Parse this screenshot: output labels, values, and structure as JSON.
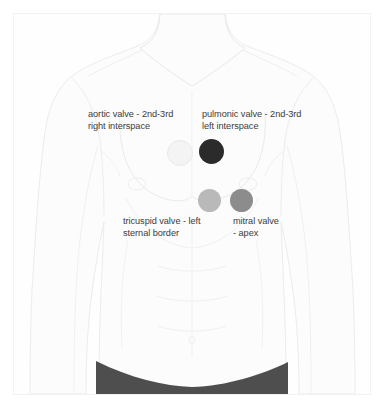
{
  "diagram": {
    "background_color": "#ffffff",
    "frame_color": "#f2f2f2",
    "body_outline_color": "#ebebeb",
    "body_fill_color": "#fdfdfd",
    "waistband_color": "#4e4e4e",
    "label_text_color": "#3b3b3b"
  },
  "markers": [
    {
      "id": "aortic",
      "name": "aortic-valve-marker",
      "color": "#f4f4f4",
      "border_color": "#e9e9e9"
    },
    {
      "id": "pulmonic",
      "name": "pulmonic-valve-marker",
      "color": "#2b2b2b",
      "border_color": "#2b2b2b"
    },
    {
      "id": "tricuspid",
      "name": "tricuspid-valve-marker",
      "color": "#b9b9b9",
      "border_color": "#b9b9b9"
    },
    {
      "id": "mitral",
      "name": "mitral-valve-marker",
      "color": "#8c8c8c",
      "border_color": "#8c8c8c"
    }
  ],
  "labels": {
    "aortic": "aortic valve - 2nd-3rd\nright interspace",
    "pulmonic": "pulmonic valve - 2nd-3rd\nleft interspace",
    "tricuspid": "tricuspid valve - left\nsternal border",
    "mitral": "mitral valve\n- apex"
  }
}
